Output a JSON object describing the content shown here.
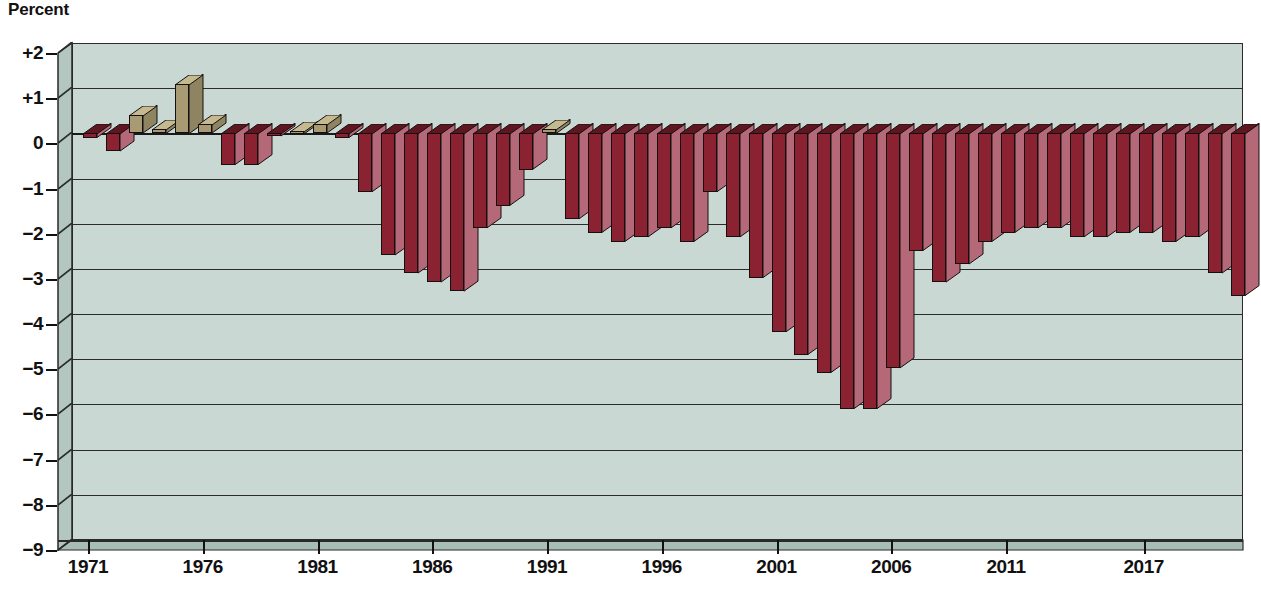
{
  "chart_data": {
    "type": "bar",
    "title": "",
    "subtitle": "",
    "unit_label": "Percent",
    "xlabel": "",
    "ylabel": "Percent",
    "ylim": [
      -9,
      2
    ],
    "ytick_labels": [
      "+2",
      "+1",
      "0",
      "−1",
      "−2",
      "−3",
      "−4",
      "−5",
      "−6",
      "−7",
      "−8",
      "−9"
    ],
    "ytick_values": [
      2,
      1,
      0,
      -1,
      -2,
      -3,
      -4,
      -5,
      -6,
      -7,
      -8,
      -9
    ],
    "xtick_labels": [
      "1971",
      "1976",
      "1981",
      "1986",
      "1991",
      "1996",
      "2001",
      "2006",
      "2011",
      "2017"
    ],
    "xtick_values": [
      1971,
      1976,
      1981,
      1986,
      1991,
      1996,
      2001,
      2006,
      2011,
      2017
    ],
    "grid": true,
    "legend": "none",
    "positive_color": "#a89a72",
    "negative_color": "#8b2232",
    "plot_background": "#c9d8d3",
    "categories": [
      1971,
      1972,
      1973,
      1974,
      1975,
      1976,
      1977,
      1978,
      1979,
      1980,
      1981,
      1982,
      1983,
      1984,
      1985,
      1986,
      1987,
      1988,
      1989,
      1990,
      1991,
      1992,
      1993,
      1994,
      1995,
      1996,
      1997,
      1998,
      1999,
      2000,
      2001,
      2002,
      2003,
      2004,
      2005,
      2006,
      2007,
      2008,
      2009,
      2010,
      2011,
      2012,
      2013,
      2014,
      2015,
      2016,
      2017,
      2018,
      2019,
      2020,
      2021
    ],
    "values": [
      -0.1,
      -0.4,
      0.4,
      0.1,
      1.1,
      0.2,
      -0.7,
      -0.7,
      -0.04,
      0.05,
      0.2,
      -0.1,
      -1.3,
      -2.7,
      -3.1,
      -3.3,
      -3.5,
      -2.1,
      -1.6,
      -0.8,
      0.1,
      -1.9,
      -2.2,
      -2.4,
      -2.3,
      -2.1,
      -2.4,
      -1.3,
      -2.3,
      -3.2,
      -4.4,
      -4.9,
      -5.3,
      -6.1,
      -6.1,
      -5.2,
      -2.6,
      -3.3,
      -2.9,
      -2.4,
      -2.2,
      -2.1,
      -2.1,
      -2.3,
      -2.3,
      -2.2,
      -2.2,
      -2.4,
      -2.3,
      -3.1,
      -3.6
    ]
  },
  "annotations": {
    "unit": "Percent"
  }
}
